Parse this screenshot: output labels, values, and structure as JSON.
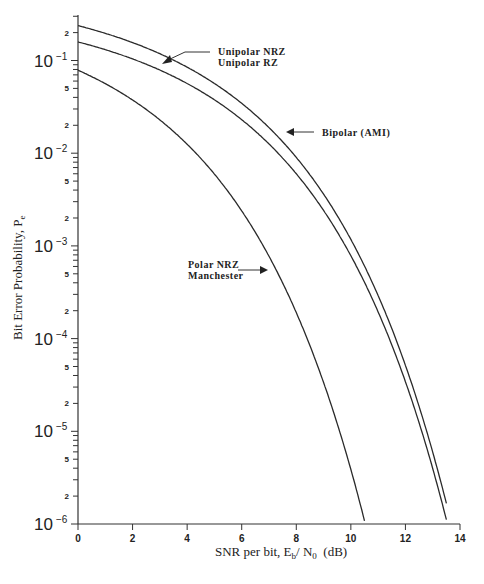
{
  "chart_data": {
    "type": "line",
    "title": "",
    "xlabel": "SNR per bit, E_b / N_0 (dB)",
    "xlabel_parts": {
      "pre": "SNR per bit, E",
      "sub1": "b",
      "mid": "/ N",
      "sub2": "0",
      "post": "  (dB)"
    },
    "ylabel": "Bit Error Probability, P_e",
    "ylabel_parts": {
      "pre": "Bit Error Probability, P",
      "sub": "e"
    },
    "xlim": [
      0,
      14
    ],
    "ylim": [
      1e-06,
      0.35
    ],
    "yscale": "log",
    "grid": false,
    "x_ticks": [
      "0",
      "2",
      "4",
      "6",
      "8",
      "10",
      "12",
      "14"
    ],
    "y_major_ticks": [
      {
        "base": "10",
        "exp": "-1"
      },
      {
        "base": "10",
        "exp": "-2"
      },
      {
        "base": "10",
        "exp": "-3"
      },
      {
        "base": "10",
        "exp": "-4"
      },
      {
        "base": "10",
        "exp": "-5"
      },
      {
        "base": "10",
        "exp": "-6"
      }
    ],
    "y_minor_labels": [
      "2",
      "5"
    ],
    "x": [
      0,
      1,
      2,
      3,
      4,
      5,
      6,
      7,
      8,
      9,
      10,
      10.5,
      11,
      12,
      13,
      13.5
    ],
    "series": [
      {
        "name": "Bipolar (AMI)",
        "values": [
          0.238,
          0.197,
          0.156,
          0.117,
          0.082,
          0.054,
          0.0325,
          0.0178,
          0.0087,
          0.0037,
          0.00134,
          0.00075,
          0.0004,
          9.5e-05,
          1.66e-05,
          6.3e-06
        ]
      },
      {
        "name": "Unipolar NRZ / Unipolar RZ",
        "values": [
          0.159,
          0.131,
          0.104,
          0.078,
          0.0548,
          0.0359,
          0.0216,
          0.0119,
          0.0058,
          0.00246,
          0.00089,
          0.0005,
          0.00027,
          6.3e-05,
          1.11e-05,
          4.2e-06
        ]
      },
      {
        "name": "Polar NRZ / Manchester",
        "values": [
          0.0786,
          0.0563,
          0.0375,
          0.0229,
          0.0125,
          0.006,
          0.00239,
          0.00077,
          0.00019,
          3.36e-05,
          3.9e-06,
          1.03e-06,
          null,
          null,
          null,
          null
        ]
      }
    ],
    "annotations": [
      {
        "label_lines": [
          "Unipolar  NRZ",
          "Unipolar  RZ"
        ]
      },
      {
        "label_lines": [
          "Bipolar  (AMI)"
        ]
      },
      {
        "label_lines": [
          "Polar  NRZ",
          "Manchester"
        ]
      }
    ]
  }
}
